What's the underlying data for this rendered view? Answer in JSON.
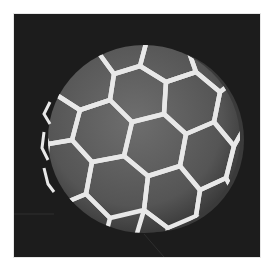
{
  "image": {
    "subject": "ball with hexagonal panel pattern",
    "style": "grayscale photograph",
    "colors": {
      "background": "#1c1c1c",
      "panel": "#5a5a5a",
      "seam": "#e8e8e8",
      "border": "#ffffff"
    }
  }
}
